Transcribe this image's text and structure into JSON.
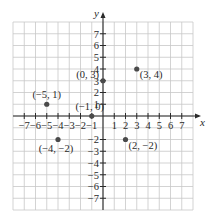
{
  "chart_data": {
    "type": "scatter",
    "title": "",
    "xlabel": "x",
    "ylabel": "y",
    "xlim": [
      -8,
      8
    ],
    "ylim": [
      -8,
      8
    ],
    "grid": true,
    "x_ticks": [
      -7,
      -6,
      -5,
      -4,
      -3,
      -2,
      -1,
      1,
      2,
      3,
      4,
      5,
      6,
      7
    ],
    "y_ticks": [
      7,
      6,
      5,
      4,
      3,
      2,
      1,
      -2,
      -3,
      -4,
      -5,
      -6,
      -7
    ],
    "points": [
      {
        "x": 0,
        "y": 3,
        "label": "(0, 3)",
        "label_side": "left"
      },
      {
        "x": 3,
        "y": 4,
        "label": "(3, 4)",
        "label_side": "right"
      },
      {
        "x": -5,
        "y": 1,
        "label": "(−5, 1)",
        "label_side": "above"
      },
      {
        "x": -1,
        "y": 0,
        "label": "(−1, 0)",
        "label_side": "above"
      },
      {
        "x": -4,
        "y": -2,
        "label": "(−4, −2)",
        "label_side": "below"
      },
      {
        "x": 2,
        "y": -2,
        "label": "(2, −2)",
        "label_side": "right"
      }
    ],
    "colors": {
      "point": "#4a4a4a",
      "grid": "#c8c8c8",
      "axis": "#2a2a2a"
    }
  }
}
